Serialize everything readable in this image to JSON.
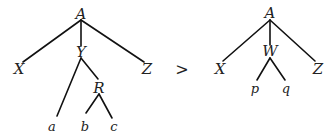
{
  "comparison": {
    "operator": ">",
    "left_tree": {
      "root": "A",
      "children": [
        {
          "label": "X"
        },
        {
          "label": "Y",
          "children": [
            {
              "label": "a"
            },
            {
              "label": "R",
              "children": [
                {
                  "label": "b"
                },
                {
                  "label": "c"
                }
              ]
            }
          ]
        },
        {
          "label": "Z"
        }
      ],
      "nodes": {
        "A": "A",
        "X": "X",
        "Y": "Y",
        "Z": "Z",
        "R": "R",
        "a": "a",
        "b": "b",
        "c": "c"
      }
    },
    "right_tree": {
      "root": "A",
      "children": [
        {
          "label": "X"
        },
        {
          "label": "W",
          "children": [
            {
              "label": "p"
            },
            {
              "label": "q"
            }
          ]
        },
        {
          "label": "Z"
        }
      ],
      "nodes": {
        "A": "A",
        "X": "X",
        "W": "W",
        "Z": "Z",
        "p": "p",
        "q": "q"
      }
    }
  }
}
